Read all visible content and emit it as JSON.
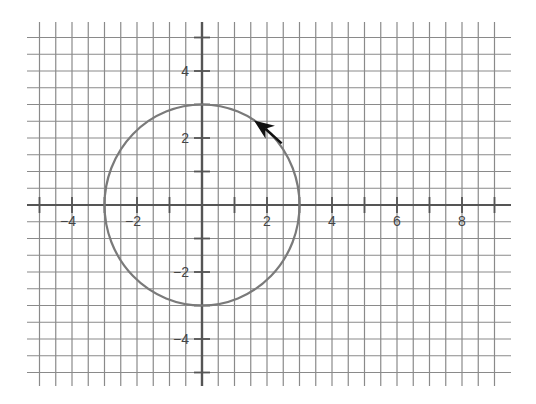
{
  "chart_data": {
    "type": "line",
    "title": "",
    "xlabel": "",
    "ylabel": "",
    "xlim": [
      -5,
      9
    ],
    "ylim": [
      -5,
      5
    ],
    "grid": true,
    "grid_step": 0.5,
    "axis_tick_step": 1,
    "x_tick_labels": [
      "−4",
      "−2",
      "2",
      "4",
      "6",
      "8"
    ],
    "x_tick_values": [
      -4,
      -2,
      2,
      4,
      6,
      8
    ],
    "y_tick_labels": [
      "4",
      "2",
      "−2",
      "−4"
    ],
    "y_tick_values": [
      4,
      2,
      -2,
      -4
    ],
    "series": [
      {
        "name": "circle",
        "shape": "circle",
        "center": [
          0,
          0
        ],
        "radius": 3,
        "equation": "x^2 + y^2 = 9",
        "direction": "counterclockwise",
        "arrow_at": [
          1.7,
          2.45
        ],
        "color": "#7a7a7a"
      }
    ],
    "legend": null
  },
  "colors": {
    "grid": "#8a8a8a",
    "axis": "#555555",
    "curve": "#7a7a7a",
    "arrow": "#111111",
    "label": "#444444",
    "background": "#ffffff"
  }
}
